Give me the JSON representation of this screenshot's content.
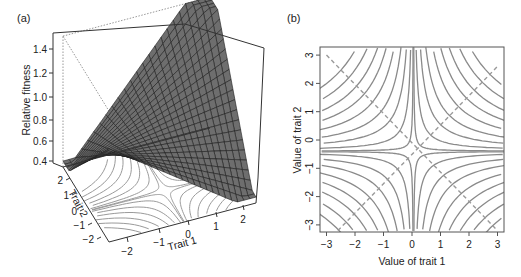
{
  "figure": {
    "panel_a_label": "(a)",
    "panel_b_label": "(b)"
  },
  "chart_data": [
    {
      "type": "surface3d",
      "panel": "(a)",
      "title": "",
      "zlabel": "Relative fitness",
      "xlabel": "Trait 1",
      "ylabel": "Trait 2",
      "zticks": [
        "0.4",
        "0.6",
        "0.8",
        "1.0",
        "1.2",
        "1.4"
      ],
      "xticks": [
        "-2",
        "-1",
        "0",
        "1",
        "2"
      ],
      "yticks": [
        "-2",
        "-1",
        "0",
        "1",
        "2"
      ],
      "zlim": [
        0.4,
        1.5
      ],
      "xlim": [
        -2.5,
        2.5
      ],
      "ylim": [
        -2.5,
        2.5
      ],
      "description": "Saddle-shaped fitness surface (wireframe grid, dark grey) with projected grey contour lines on the base plane",
      "surface_peaks": [
        {
          "corner": "back-right",
          "z": 1.5
        },
        {
          "corner": "back-left (minor peak)",
          "z": 1.02
        }
      ],
      "surface_min_edge_z": 0.55
    },
    {
      "type": "contour",
      "panel": "(b)",
      "title": "",
      "xlabel": "Value of trait 1",
      "ylabel": "Value of trait 2",
      "xticks": [
        "-3",
        "-2",
        "-1",
        "0",
        "1",
        "2",
        "3"
      ],
      "yticks": [
        "-3",
        "-2",
        "-1",
        "0",
        "1",
        "2",
        "3"
      ],
      "xlim": [
        -3.2,
        3.2
      ],
      "ylim": [
        -3.2,
        3.2
      ],
      "saddle_point": [
        0.05,
        -0.4
      ],
      "contour_levels": [
        0.05,
        0.35,
        0.9,
        1.6,
        2.5,
        3.5,
        4.6,
        5.9,
        7.3
      ],
      "dashed_lines": [
        {
          "from": [
            -3,
            3
          ],
          "to": [
            3,
            -3.2
          ]
        },
        {
          "from": [
            -2.6,
            -3.2
          ],
          "to": [
            3,
            2.6
          ]
        }
      ],
      "grid": false
    }
  ]
}
